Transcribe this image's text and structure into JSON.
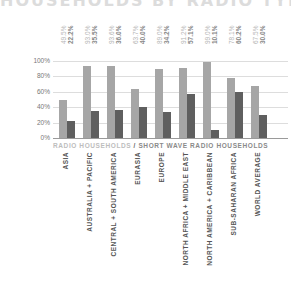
{
  "title": "HOUSEHOLDS BY RADIO TYPE",
  "legend": {
    "series1": "RADIO HOUSEHOLDS",
    "separator": " / ",
    "series2": "SHORT WAVE RADIO HOUSEHOLDS"
  },
  "y_ticks": [
    "100%",
    "80%",
    "60%",
    "40%",
    "20%",
    "0%"
  ],
  "value_labels": [
    {
      "a": "49.5%",
      "b": "22.2%"
    },
    {
      "a": "93.0%",
      "b": "35.5%"
    },
    {
      "a": "93.6%",
      "b": "36.0%"
    },
    {
      "a": "63.7%",
      "b": "40.0%"
    },
    {
      "a": "89.0%",
      "b": "34.2%"
    },
    {
      "a": "91.2%",
      "b": "57.1%"
    },
    {
      "a": "99.0%",
      "b": "10.1%"
    },
    {
      "a": "78.1%",
      "b": "60.2%"
    },
    {
      "a": "67.5%",
      "b": "30.0%"
    }
  ],
  "categories": [
    "ASIA",
    "AUSTRALIA + PACIFIC",
    "CENTRAL + SOUTH AMERICA",
    "EURASIA",
    "EUROPE",
    "NORTH AFRICA + MIDDLE EAST",
    "NORTH AMERICA + CARIBBEAN",
    "SUB-SAHARAN AFRICA",
    "WORLD AVERAGE"
  ],
  "colors": {
    "radio": "#a6a6a6",
    "shortwave": "#5f5f5f"
  },
  "chart_data": {
    "type": "bar",
    "title": "HOUSEHOLDS BY RADIO TYPE",
    "categories": [
      "ASIA",
      "AUSTRALIA + PACIFIC",
      "CENTRAL + SOUTH AMERICA",
      "EURASIA",
      "EUROPE",
      "NORTH AFRICA + MIDDLE EAST",
      "NORTH AMERICA + CARIBBEAN",
      "SUB-SAHARAN AFRICA",
      "WORLD AVERAGE"
    ],
    "series": [
      {
        "name": "RADIO HOUSEHOLDS",
        "values": [
          49.5,
          93.0,
          93.6,
          63.7,
          89.0,
          91.2,
          99.0,
          78.1,
          67.5
        ],
        "color": "#a6a6a6"
      },
      {
        "name": "SHORT WAVE RADIO HOUSEHOLDS",
        "values": [
          22.2,
          35.5,
          36.0,
          40.0,
          34.2,
          57.1,
          10.1,
          60.2,
          30.0
        ],
        "color": "#5f5f5f"
      }
    ],
    "xlabel": "",
    "ylabel": "",
    "ylim": [
      0,
      100
    ],
    "y_ticks": [
      "0%",
      "20%",
      "40%",
      "60%",
      "80%",
      "100%"
    ],
    "grid": true,
    "legend_position": "below-plot"
  }
}
